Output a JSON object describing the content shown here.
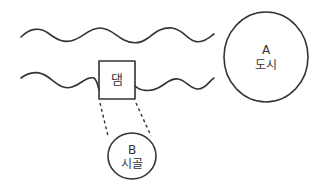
{
  "diagram": {
    "title": "",
    "nodes": [
      {
        "id": "dam",
        "label": "댐",
        "shape": "rectangle"
      },
      {
        "id": "city",
        "letter": "A",
        "label": "도시",
        "shape": "circle"
      },
      {
        "id": "village",
        "letter": "B",
        "label": "시골",
        "shape": "circle"
      }
    ],
    "river": {
      "banks": 2,
      "style": "wavy lines"
    },
    "connections": [
      {
        "from": "dam",
        "to": "village",
        "style": "dashed"
      }
    ],
    "colors": {
      "line": "#333333",
      "background": "#ffffff"
    }
  }
}
